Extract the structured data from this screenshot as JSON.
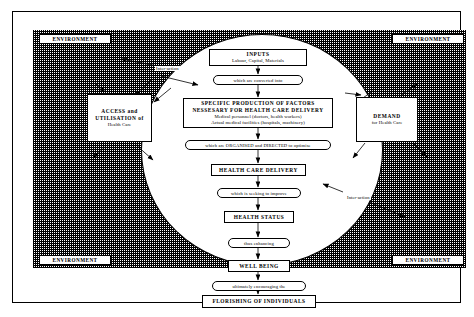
{
  "diagram": {
    "environment_label": "ENVIRONMENT",
    "interaction_label": "Inter-action",
    "environment_corners": [
      "ENVIRONMENT",
      "ENVIRONMENT",
      "ENVIRONMENT",
      "ENVIRONMENT"
    ],
    "nodes": {
      "inputs": {
        "heading": "INPUTS",
        "detail": "Labour,  Capital,  Materials"
      },
      "production": {
        "heading_line1": "SPECIFIC PRODUCTION OF FACTORS",
        "heading_line2": "NESSESARY FOR HEALTH CARE DELIVERY",
        "detail_line1": "Medical personnel (doctors, health workers)",
        "detail_line2": "Actual medical facilities (hospitals, machinery)"
      },
      "delivery": {
        "heading": "HEALTH CARE DELIVERY"
      },
      "status": {
        "heading": "HEALTH STATUS"
      },
      "wellbeing": {
        "heading": "WELL BEING"
      },
      "florishing": {
        "heading": "FLORISHING OF INDIVIDUALS"
      },
      "access": {
        "heading_line1": "ACCESS and",
        "heading_line2": "UTILISATION of",
        "detail": "Health Care"
      },
      "demand": {
        "heading": "DEMAND",
        "detail": "for Health Care"
      }
    },
    "connectors": {
      "converted": "which are converted into",
      "organised": "which are ORGANISED and DIRECTED to optimise",
      "improve": "which is seeking to improve",
      "enhancing": "thus enhancing",
      "ultimately": "ultimately encouraging the"
    },
    "colors": {
      "line": "#000000",
      "background": "#ffffff",
      "hatch": "#000000"
    }
  }
}
